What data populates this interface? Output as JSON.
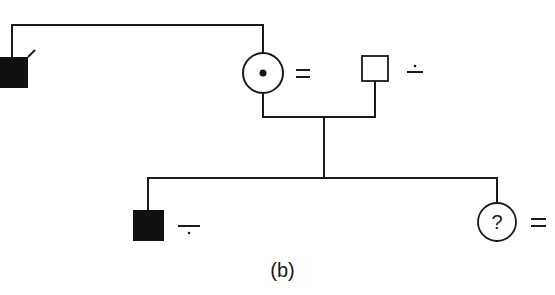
{
  "diagram": {
    "type": "pedigree",
    "caption": "(b)",
    "colors": {
      "ink": "#1a1a1a",
      "background": "#ffffff"
    },
    "generation_1": {
      "individuals": [
        {
          "id": "I-1",
          "sex": "male",
          "status": "affected",
          "deceased": true,
          "marker": ""
        },
        {
          "id": "I-2",
          "sex": "female",
          "status": "carrier",
          "marker": "="
        },
        {
          "id": "I-3",
          "sex": "male",
          "status": "unaffected",
          "marker": "÷"
        }
      ],
      "relationships": [
        {
          "type": "sibling",
          "between": [
            "I-1",
            "I-2"
          ]
        },
        {
          "type": "mating",
          "between": [
            "I-2",
            "I-3"
          ]
        }
      ]
    },
    "generation_2": {
      "individuals": [
        {
          "id": "II-1",
          "sex": "male",
          "status": "affected",
          "marker": "−·"
        },
        {
          "id": "II-2",
          "sex": "female",
          "status": "unknown",
          "symbol_text": "?",
          "marker": "="
        }
      ]
    },
    "labels": {
      "mother_marker": "=",
      "father_marker": "÷",
      "son_marker_bar": "−",
      "daughter_symbol": "?",
      "daughter_marker": "="
    }
  }
}
